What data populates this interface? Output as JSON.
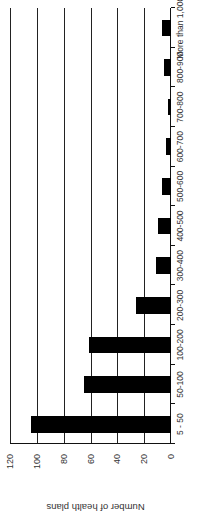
{
  "chart_data": {
    "type": "bar",
    "orientation": "rotated page (vertical bar chart rotated 90° counter-clockwise)",
    "title": "",
    "xlabel": "",
    "ylabel": "Number of health plans",
    "categories": [
      "5 - 50",
      "50-100",
      "100-200",
      "200-300",
      "300-400",
      "400-500",
      "500-600",
      "600-700",
      "700-800",
      "800-900",
      "More than 1,000"
    ],
    "values": [
      104,
      65,
      61,
      26,
      11,
      10,
      7,
      4,
      2.5,
      5.5,
      7
    ],
    "ylim": [
      0,
      120
    ],
    "yticks": [
      0,
      20,
      40,
      60,
      80,
      100,
      120
    ],
    "grid": true,
    "legend": null,
    "bar_color": "#000000"
  }
}
